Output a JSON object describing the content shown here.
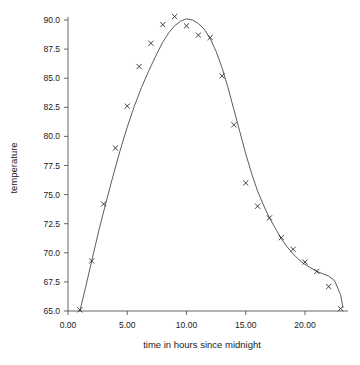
{
  "chart_data": {
    "type": "scatter",
    "title": "",
    "xlabel": "time in hours since midnight",
    "ylabel": "temperature",
    "xlim": [
      -0.9,
      23.6
    ],
    "ylim": [
      64.6,
      90.9
    ],
    "grid": false,
    "legend": null,
    "xticks": [
      0,
      5,
      10,
      15,
      20
    ],
    "xticklabels": [
      "0.00",
      "5.00",
      "10.00",
      "15.00",
      "20.00"
    ],
    "yticks": [
      65.0,
      67.5,
      70.0,
      72.5,
      75.0,
      77.5,
      80.0,
      82.5,
      85.0,
      87.5,
      90.0
    ],
    "yticklabels": [
      "65.0",
      "67.5",
      "70.0",
      "72.5",
      "75.0",
      "77.5",
      "80.0",
      "82.5",
      "85.0",
      "87.5",
      "90.0"
    ],
    "marker": "x",
    "marker_color": "#222222",
    "line_color": "#4a4a4a",
    "series": [
      {
        "name": "temperature",
        "x": [
          1,
          2,
          3,
          4,
          5,
          6,
          7,
          8,
          9,
          10,
          11,
          12,
          13,
          14,
          15,
          16,
          17,
          18,
          19,
          20,
          21,
          22,
          23
        ],
        "values": [
          65.1,
          69.3,
          74.2,
          79.0,
          82.6,
          86.0,
          88.0,
          89.6,
          90.3,
          89.5,
          88.7,
          88.5,
          85.2,
          81.0,
          76.0,
          74.0,
          73.0,
          71.3,
          70.3,
          69.2,
          68.4,
          67.1,
          65.2
        ]
      }
    ],
    "fit_curve": {
      "name": "smooth fit",
      "x": [
        1.0,
        1.5,
        2.0,
        2.6,
        3.2,
        3.8,
        4.4,
        5.0,
        5.6,
        6.2,
        6.8,
        7.4,
        8.0,
        8.5,
        9.0,
        9.5,
        10.0,
        10.5,
        11.0,
        11.5,
        12.0,
        12.5,
        13.0,
        13.5,
        14.0,
        14.5,
        15.0,
        15.5,
        16.0,
        16.5,
        17.0,
        17.5,
        18.0,
        18.5,
        19.0,
        19.5,
        20.0,
        20.5,
        21.0,
        21.5,
        22.0,
        22.5,
        23.0,
        23.2
      ],
      "values": [
        65.0,
        67.1,
        69.3,
        71.9,
        74.3,
        76.6,
        78.8,
        80.8,
        82.6,
        84.2,
        85.6,
        86.9,
        88.1,
        88.9,
        89.5,
        89.9,
        90.1,
        90.0,
        89.7,
        89.2,
        88.4,
        87.3,
        85.9,
        84.2,
        82.3,
        80.4,
        78.5,
        76.8,
        75.3,
        74.1,
        73.0,
        72.1,
        71.2,
        70.5,
        69.9,
        69.4,
        69.0,
        68.7,
        68.4,
        68.2,
        68.0,
        67.6,
        66.4,
        65.3
      ]
    }
  }
}
